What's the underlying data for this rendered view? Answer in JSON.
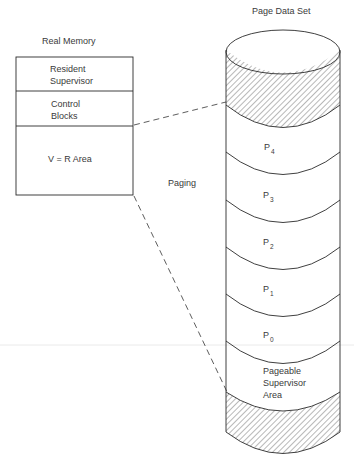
{
  "real_memory": {
    "title": "Real Memory",
    "sections": [
      {
        "line1": "Resident",
        "line2": "Supervisor"
      },
      {
        "line1": "Control",
        "line2": "Blocks"
      },
      {
        "line1": "V = R Area",
        "line2": ""
      }
    ]
  },
  "page_data_set": {
    "title": "Page Data Set",
    "pages": [
      {
        "base": "P",
        "sub": "4"
      },
      {
        "base": "P",
        "sub": "3"
      },
      {
        "base": "P",
        "sub": "2"
      },
      {
        "base": "P",
        "sub": "1"
      },
      {
        "base": "P",
        "sub": "0"
      }
    ],
    "pageable": {
      "line1": "Pageable",
      "line2": "Supervisor",
      "line3": "Area"
    }
  },
  "paging_label": "Paging"
}
